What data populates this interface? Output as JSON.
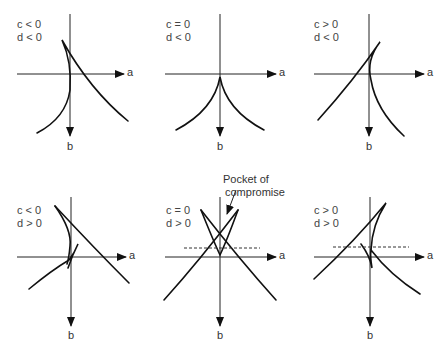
{
  "figure": {
    "panels": [
      {
        "id": "p1",
        "c": "c < 0",
        "d": "d < 0",
        "axis_x": "a",
        "axis_y": "b"
      },
      {
        "id": "p2",
        "c": "c = 0",
        "d": "d < 0",
        "axis_x": "a",
        "axis_y": "b"
      },
      {
        "id": "p3",
        "c": "c > 0",
        "d": "d < 0",
        "axis_x": "a",
        "axis_y": "b"
      },
      {
        "id": "p4",
        "c": "c < 0",
        "d": "d > 0",
        "axis_x": "a",
        "axis_y": "b"
      },
      {
        "id": "p5",
        "c": "c = 0",
        "d": "d > 0",
        "axis_x": "a",
        "axis_y": "b"
      },
      {
        "id": "p6",
        "c": "c > 0",
        "d": "d > 0",
        "axis_x": "a",
        "axis_y": "b"
      }
    ],
    "annotation": {
      "line1": "Pocket of",
      "line2": "compromise"
    }
  }
}
